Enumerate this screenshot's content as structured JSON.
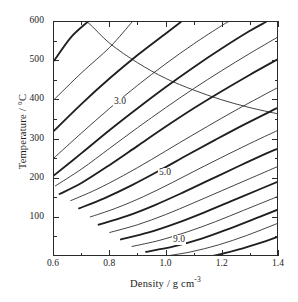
{
  "figure": {
    "kind": "contour-plot",
    "background": "#ffffff",
    "line_color": "#1f1f1f",
    "frame_color": "#2b2b2b"
  },
  "axes": {
    "x": {
      "title_main": "Density / g cm",
      "title_exponent": "-3",
      "min": 0.6,
      "max": 1.4,
      "major_ticks": [
        0.6,
        0.8,
        1.0,
        1.2,
        1.4
      ],
      "major_tick_labels": [
        "0.6",
        "0.8",
        "1.0",
        "1.2",
        "1.4"
      ],
      "minor_ticks": [
        0.7,
        0.9,
        1.1,
        1.3
      ]
    },
    "y": {
      "title": "Temperature / °C",
      "min": 0,
      "max": 600,
      "major_ticks": [
        100,
        200,
        300,
        400,
        500,
        600
      ],
      "major_tick_labels": [
        "100",
        "200",
        "300",
        "400",
        "500",
        "600"
      ],
      "minor_ticks": [
        50,
        150,
        250,
        350,
        450,
        550
      ]
    }
  },
  "chart_data": {
    "type": "line",
    "title": "",
    "xlabel": "Density / g cm -3",
    "ylabel": "Temperature / °C",
    "xlim": [
      0.6,
      1.4
    ],
    "ylim": [
      0,
      600
    ],
    "grid": false,
    "legend": "none",
    "labelled_levels": [
      "3.0",
      "5.0",
      "9.0"
    ],
    "level_labels": [
      {
        "text": "3.0",
        "x": 0.845,
        "y": 392
      },
      {
        "text": "5.0",
        "x": 1.005,
        "y": 213
      },
      {
        "text": "9.0",
        "x": 1.055,
        "y": 40
      }
    ],
    "series": [
      {
        "name": "1.5",
        "weight": "thin",
        "points": [
          [
            0.6,
            700
          ],
          [
            0.66,
            628
          ],
          [
            0.72,
            600
          ],
          [
            0.8,
            545
          ],
          [
            0.9,
            495
          ],
          [
            1.0,
            455
          ],
          [
            1.1,
            425
          ],
          [
            1.2,
            400
          ],
          [
            1.3,
            380
          ],
          [
            1.4,
            364
          ]
        ]
      },
      {
        "name": "2.0",
        "weight": "thick",
        "points": [
          [
            0.6,
            500
          ],
          [
            0.66,
            560
          ],
          [
            0.72,
            600
          ]
        ]
      },
      {
        "name": "2.5",
        "weight": "thin",
        "points": [
          [
            0.6,
            400
          ],
          [
            0.7,
            470
          ],
          [
            0.8,
            535
          ],
          [
            0.88,
            600
          ]
        ]
      },
      {
        "name": "3.0",
        "weight": "thick",
        "points": [
          [
            0.6,
            320
          ],
          [
            0.7,
            390
          ],
          [
            0.8,
            455
          ],
          [
            0.9,
            515
          ],
          [
            1.0,
            570
          ],
          [
            1.055,
            600
          ]
        ]
      },
      {
        "name": "3.5",
        "weight": "thin",
        "points": [
          [
            0.6,
            250
          ],
          [
            0.7,
            315
          ],
          [
            0.8,
            378
          ],
          [
            0.9,
            437
          ],
          [
            1.0,
            492
          ],
          [
            1.1,
            543
          ],
          [
            1.2,
            590
          ],
          [
            1.225,
            600
          ]
        ]
      },
      {
        "name": "4.0",
        "weight": "thick",
        "points": [
          [
            0.6,
            205
          ],
          [
            0.7,
            263
          ],
          [
            0.8,
            322
          ],
          [
            0.9,
            378
          ],
          [
            1.0,
            432
          ],
          [
            1.1,
            483
          ],
          [
            1.2,
            531
          ],
          [
            1.3,
            576
          ],
          [
            1.36,
            600
          ]
        ]
      },
      {
        "name": "4.5",
        "weight": "thin",
        "points": [
          [
            0.605,
            178
          ],
          [
            0.7,
            222
          ],
          [
            0.8,
            275
          ],
          [
            0.9,
            328
          ],
          [
            1.0,
            379
          ],
          [
            1.1,
            428
          ],
          [
            1.2,
            474
          ],
          [
            1.3,
            518
          ],
          [
            1.4,
            560
          ]
        ]
      },
      {
        "name": "5.0",
        "weight": "thick",
        "points": [
          [
            0.62,
            157
          ],
          [
            0.7,
            186
          ],
          [
            0.8,
            232
          ],
          [
            0.9,
            281
          ],
          [
            1.0,
            330
          ],
          [
            1.1,
            377
          ],
          [
            1.2,
            421
          ],
          [
            1.3,
            463
          ],
          [
            1.4,
            503
          ]
        ]
      },
      {
        "name": "5.5",
        "weight": "thin",
        "points": [
          [
            0.66,
            140
          ],
          [
            0.75,
            168
          ],
          [
            0.85,
            205
          ],
          [
            0.95,
            246
          ],
          [
            1.05,
            289
          ],
          [
            1.15,
            331
          ],
          [
            1.25,
            372
          ],
          [
            1.35,
            411
          ],
          [
            1.4,
            430
          ]
        ]
      },
      {
        "name": "6.0",
        "weight": "thick",
        "points": [
          [
            0.69,
            120
          ],
          [
            0.78,
            146
          ],
          [
            0.88,
            180
          ],
          [
            0.98,
            218
          ],
          [
            1.08,
            258
          ],
          [
            1.18,
            297
          ],
          [
            1.28,
            335
          ],
          [
            1.38,
            371
          ],
          [
            1.4,
            378
          ]
        ]
      },
      {
        "name": "6.5",
        "weight": "thin",
        "points": [
          [
            0.73,
            98
          ],
          [
            0.82,
            120
          ],
          [
            0.92,
            150
          ],
          [
            1.02,
            185
          ],
          [
            1.12,
            222
          ],
          [
            1.22,
            258
          ],
          [
            1.32,
            293
          ],
          [
            1.4,
            320
          ]
        ]
      },
      {
        "name": "7.0",
        "weight": "thick",
        "points": [
          [
            0.76,
            78
          ],
          [
            0.86,
            100
          ],
          [
            0.96,
            128
          ],
          [
            1.06,
            160
          ],
          [
            1.16,
            194
          ],
          [
            1.26,
            228
          ],
          [
            1.36,
            261
          ],
          [
            1.4,
            273
          ]
        ]
      },
      {
        "name": "7.5",
        "weight": "thin",
        "points": [
          [
            0.8,
            58
          ],
          [
            0.9,
            78
          ],
          [
            1.0,
            104
          ],
          [
            1.1,
            134
          ],
          [
            1.2,
            165
          ],
          [
            1.3,
            196
          ],
          [
            1.4,
            227
          ]
        ]
      },
      {
        "name": "8.0",
        "weight": "thick",
        "points": [
          [
            0.84,
            40
          ],
          [
            0.94,
            58
          ],
          [
            1.04,
            82
          ],
          [
            1.14,
            110
          ],
          [
            1.24,
            140
          ],
          [
            1.34,
            170
          ],
          [
            1.4,
            188
          ]
        ]
      },
      {
        "name": "8.5",
        "weight": "thin",
        "points": [
          [
            0.88,
            22
          ],
          [
            0.98,
            38
          ],
          [
            1.08,
            60
          ],
          [
            1.18,
            86
          ],
          [
            1.28,
            115
          ],
          [
            1.38,
            144
          ],
          [
            1.4,
            150
          ]
        ]
      },
      {
        "name": "9.0",
        "weight": "thick",
        "points": [
          [
            0.93,
            8
          ],
          [
            1.03,
            22
          ],
          [
            1.13,
            42
          ],
          [
            1.23,
            68
          ],
          [
            1.33,
            96
          ],
          [
            1.4,
            116
          ]
        ]
      },
      {
        "name": "9.5",
        "weight": "thin",
        "points": [
          [
            0.99,
            -4
          ],
          [
            1.09,
            8
          ],
          [
            1.19,
            26
          ],
          [
            1.29,
            50
          ],
          [
            1.39,
            78
          ],
          [
            1.4,
            81
          ]
        ]
      },
      {
        "name": "10.0",
        "weight": "thick",
        "points": [
          [
            1.06,
            -16
          ],
          [
            1.16,
            -4
          ],
          [
            1.26,
            14
          ],
          [
            1.36,
            36
          ],
          [
            1.4,
            46
          ]
        ]
      }
    ]
  }
}
